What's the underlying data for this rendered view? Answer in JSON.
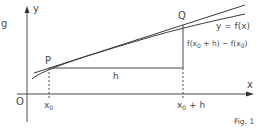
{
  "diagram": {
    "margin_letter": "g",
    "axes": {
      "x_label": "x",
      "y_label": "y",
      "origin_label": "O"
    },
    "points": [
      {
        "name": "P",
        "x": 49,
        "y": 68
      },
      {
        "name": "Q",
        "x": 183,
        "y": 25
      }
    ],
    "curve_label": "y = f(x)",
    "horizontal_segment_label": "h",
    "vertical_segment_label": {
      "f1": "f(x",
      "sub1": "0",
      "mid": " + h) − f(x",
      "sub2": "0",
      "end": ")"
    },
    "x_ticks": [
      {
        "base": "x",
        "sub": "0",
        "suffix": ""
      },
      {
        "base": "x",
        "sub": "0",
        "suffix": " + h"
      }
    ],
    "figure_caption": "Fig. 1",
    "colors": {
      "line": "#3a3a3a",
      "axis": "#4a4a4a"
    }
  }
}
